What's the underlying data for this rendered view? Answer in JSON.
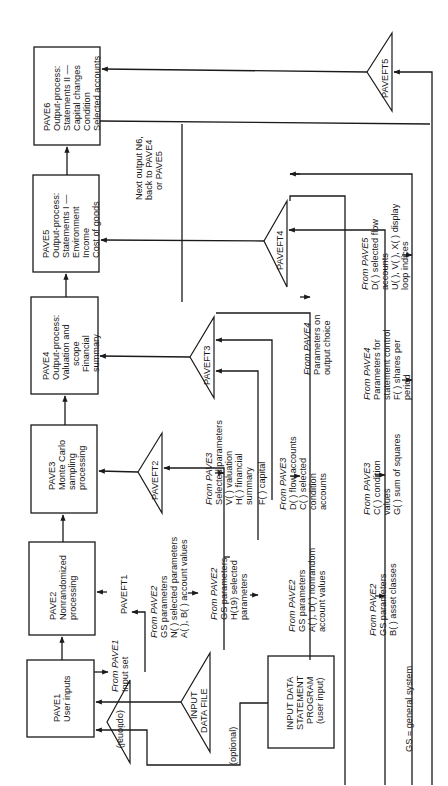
{
  "diagram": {
    "orientation": "rotated-90-ccw",
    "boxes": {
      "pave1": {
        "lines": [
          "PAVE1",
          "User inputs"
        ]
      },
      "pave2": {
        "lines": [
          "PAVE2",
          "Nonrandomized",
          "processing"
        ]
      },
      "pave3": {
        "lines": [
          "PAVE3",
          "Monte Carlo",
          "sampling",
          "processing"
        ]
      },
      "pave4": {
        "lines": [
          "PAVE4",
          "Output-process:",
          "Valuation and",
          "scope",
          "Financial",
          "summary"
        ]
      },
      "pave5": {
        "lines": [
          "PAVE5",
          "Output-process:",
          "Statements I —",
          "Environment",
          "Income",
          "Cost of goods"
        ]
      },
      "pave6": {
        "lines": [
          "PAVE6",
          "Output-process:",
          "Statements II —",
          "Capital changes",
          "Condition",
          "Selected accounts"
        ]
      },
      "input_program": {
        "lines": [
          "INPUT DATA",
          "STATEMENT",
          "PROGRAM",
          "(user input)"
        ]
      }
    },
    "files": {
      "input_data_file": {
        "lines": [
          "INPUT",
          "DATA FILE"
        ]
      },
      "paveft1": {
        "label": "PAVEFT1"
      },
      "paveft2": {
        "label": "PAVEFT2"
      },
      "paveft3": {
        "label": "PAVEFT3"
      },
      "paveft4": {
        "label": "PAVEFT4"
      },
      "paveft5": {
        "label": "PAVEFT5"
      }
    },
    "labels": {
      "optional_1": "(optional)",
      "optional_2": "(optional)",
      "next_output": [
        "Next output N6,",
        "back to PAVE4",
        "or PAVE5"
      ],
      "from_pave1": {
        "from": "From PAVE1",
        "lines": [
          "Input set"
        ]
      },
      "ft1_from_pave2": {
        "from": "From PAVE2",
        "lines": [
          "GS parameters",
          "N( ) selected parameters",
          "A( ), B( ) account values"
        ]
      },
      "ft2_from_pave2": {
        "from": "From PAVE2",
        "lines": [
          "GS parameters",
          "H(19) selected",
          "parameters"
        ]
      },
      "ft2_from_pave3": {
        "from": "From PAVE3",
        "lines": [
          "Selected parameters",
          "V( ) valuation",
          "H( )  financial",
          "        summary",
          "F( ) capital"
        ]
      },
      "ft3_from_pave2": {
        "from": "From PAVE2",
        "lines": [
          "GS parameters",
          "A( ), D( ) nonrandom",
          "account values"
        ]
      },
      "ft3_from_pave3": {
        "from": "From PAVE3",
        "lines": [
          "D( ) flow accounts",
          "C( ) selected",
          "      condition",
          "      accounts"
        ]
      },
      "ft3_from_pave4": {
        "from": "From PAVE4",
        "lines": [
          "Parameters on",
          "output choice"
        ]
      },
      "ft4_from_pave2": {
        "from": "From PAVE2",
        "lines": [
          "GS parameters",
          "B( ) asset classes"
        ]
      },
      "ft4_from_pave3": {
        "from": "From PAVE3",
        "lines": [
          "C( ) condition",
          "      values",
          "G( ) sum of squares"
        ]
      },
      "ft4_from_pave4": {
        "from": "From PAVE4",
        "lines": [
          "Parameters for",
          "statement control",
          "F( ) shares per",
          "      period"
        ]
      },
      "ft5_from_pave5": {
        "from": "From PAVE5",
        "lines": [
          "D( ) selected flow",
          "      accounts",
          "U( ), V( ), X( ) display",
          "loop indices"
        ]
      },
      "footnote": "GS = general system"
    }
  }
}
